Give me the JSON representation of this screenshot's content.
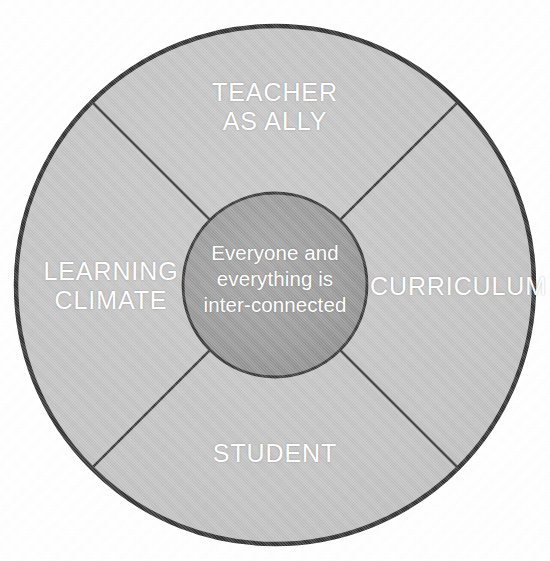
{
  "figure": {
    "type": "concentric-circle-quadrant-diagram",
    "background_color": "#ffffff"
  },
  "outer_circle": {
    "fill_color": "#c4c4c4",
    "stroke_color": "#333333",
    "center_x": 275,
    "center_y": 285,
    "radius": 259
  },
  "inner_circle": {
    "fill_color": "#9a9a9a",
    "stroke_color": "#3a3a3a",
    "center_x": 275,
    "center_y": 285,
    "radius": 92
  },
  "dividers": {
    "stroke_color": "#3b3b3b",
    "angles_deg": [
      45,
      135,
      225,
      315
    ]
  },
  "center": {
    "text": "Everyone and\neverything is\ninter-connected",
    "text_color": "#ffffff"
  },
  "quadrants": [
    {
      "id": "teacher-as-ally",
      "label": "TEACHER\nAS ALLY",
      "position": "top",
      "text_color": "#ffffff"
    },
    {
      "id": "curriculum",
      "label": "CURRICULUM",
      "position": "right",
      "text_color": "#ffffff"
    },
    {
      "id": "student",
      "label": "STUDENT",
      "position": "bottom",
      "text_color": "#ffffff"
    },
    {
      "id": "learning-climate",
      "label": "LEARNING\nCLIMATE",
      "position": "left",
      "text_color": "#ffffff"
    }
  ]
}
